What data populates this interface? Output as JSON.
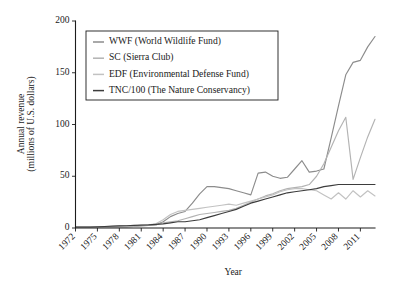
{
  "chart_data": {
    "type": "line",
    "title": "",
    "xlabel": "Year",
    "ylabel": "Annual revenue\n(millions of U.S. dollars)",
    "ylabel_line1": "Annual revenue",
    "ylabel_line2": "(millions of U.S. dollars)",
    "xlim": [
      1972,
      2013
    ],
    "ylim": [
      0,
      200
    ],
    "grid": false,
    "legend_position": "upper-left",
    "ytick_labels": [
      "0",
      "50",
      "100",
      "150",
      "200"
    ],
    "ytick_values": [
      0,
      50,
      100,
      150,
      200
    ],
    "xtick_labels": [
      "1972",
      "1975",
      "1978",
      "1981",
      "1984",
      "1987",
      "1990",
      "1993",
      "1996",
      "1999",
      "2002",
      "2005",
      "2008",
      "2011"
    ],
    "xtick_values": [
      1972,
      1975,
      1978,
      1981,
      1984,
      1987,
      1990,
      1993,
      1996,
      1999,
      2002,
      2005,
      2008,
      2011
    ],
    "x": [
      1972,
      1973,
      1974,
      1975,
      1976,
      1977,
      1978,
      1979,
      1980,
      1981,
      1982,
      1983,
      1984,
      1985,
      1986,
      1987,
      1988,
      1989,
      1990,
      1991,
      1992,
      1993,
      1994,
      1995,
      1996,
      1997,
      1998,
      1999,
      2000,
      2001,
      2002,
      2003,
      2004,
      2005,
      2006,
      2007,
      2008,
      2009,
      2010,
      2011,
      2012,
      2013
    ],
    "series": [
      {
        "name": "WWF",
        "label": "WWF (World Wildlife Fund)",
        "color": "#8c8c8c",
        "values": [
          1,
          1,
          1,
          1,
          1,
          1,
          1,
          1,
          1.5,
          2,
          2.5,
          3,
          6,
          11,
          14,
          16,
          24,
          33,
          40,
          40,
          39,
          38,
          36,
          34,
          32,
          53,
          54,
          50,
          48,
          49,
          57,
          65,
          54,
          55,
          57,
          87,
          118,
          148,
          160,
          162,
          175,
          185
        ]
      },
      {
        "name": "SC",
        "label": "SC (Sierra Club)",
        "color": "#b3b3b3",
        "values": [
          1,
          1,
          1,
          1,
          1.5,
          1.5,
          2,
          2,
          2,
          2.5,
          3,
          3,
          5,
          6,
          7,
          9,
          11,
          13,
          14,
          15,
          16,
          17,
          19,
          22,
          25,
          28,
          31,
          33,
          36,
          38,
          39,
          40,
          42,
          50,
          62,
          78,
          94,
          107,
          47,
          68,
          88,
          105
        ]
      },
      {
        "name": "EDF",
        "label": "EDF (Environmental Defense Fund)",
        "color": "#c2c2c2",
        "values": [
          0.8,
          0.8,
          1,
          1,
          1,
          1.2,
          1.5,
          1.8,
          2,
          2.5,
          3,
          4,
          8,
          13,
          16,
          17,
          18,
          19,
          20,
          21,
          22,
          23,
          22,
          24,
          26,
          28,
          30,
          32,
          35,
          37,
          38,
          38,
          37,
          36,
          32,
          28,
          34,
          28,
          36,
          30,
          36,
          31
        ]
      },
      {
        "name": "TNC/100",
        "label": "TNC/100 (The Nature Conservancy)",
        "color": "#3d3d3d",
        "values": [
          1,
          1,
          1,
          1.2,
          1.5,
          1.8,
          2,
          2.2,
          2.5,
          2.8,
          3,
          3.5,
          4,
          5,
          6,
          6,
          7,
          8,
          10,
          12,
          14,
          16,
          18,
          21,
          24,
          26,
          28,
          30,
          32,
          34,
          35,
          36,
          37,
          38,
          40,
          41,
          42,
          42,
          42,
          42,
          42,
          42
        ]
      }
    ]
  }
}
